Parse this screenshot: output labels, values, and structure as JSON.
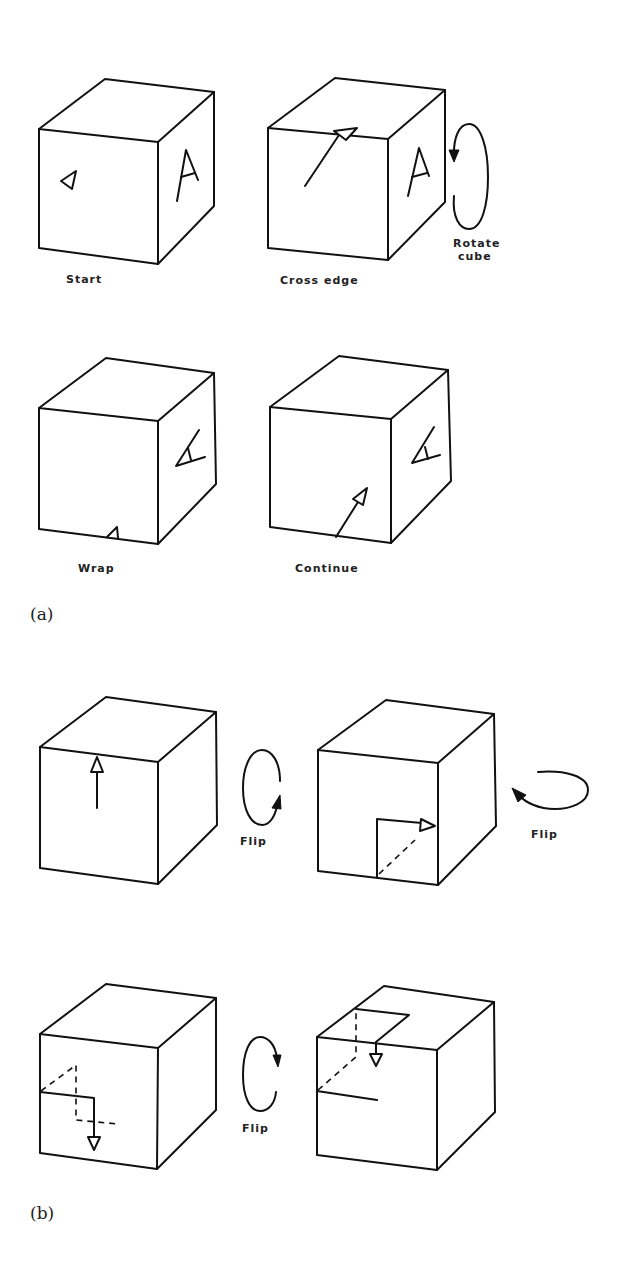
{
  "figure": {
    "part_a": {
      "label": "(a)",
      "panels": [
        {
          "caption": "Start"
        },
        {
          "caption": "Cross edge",
          "side_caption_line1": "Rotate",
          "side_caption_line2": "cube"
        },
        {
          "caption": "Wrap"
        },
        {
          "caption": "Continue"
        }
      ],
      "face_letter": "A"
    },
    "part_b": {
      "label": "(b)",
      "flip_labels": [
        "Flip",
        "Flip",
        "Flip"
      ]
    }
  },
  "colors": {
    "ink": "#111111",
    "background": "#ffffff"
  }
}
